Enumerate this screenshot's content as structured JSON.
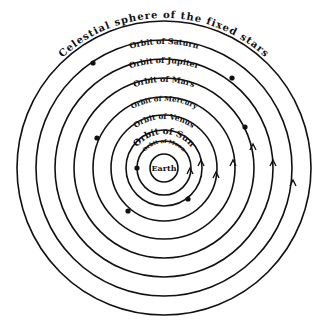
{
  "diagram": {
    "center": {
      "x": 164,
      "y": 168
    },
    "earth": {
      "label": "Earth",
      "radius": 14
    },
    "orbits": [
      {
        "name": "moon",
        "label": "Orbit of Moon",
        "radius": 27,
        "font_size": 6
      },
      {
        "name": "sun",
        "label": "Orbit of Sun",
        "radius": 38,
        "font_size": 9
      },
      {
        "name": "venus",
        "label": "Orbit of Venus",
        "radius": 53,
        "font_size": 8
      },
      {
        "name": "mercury",
        "label": "Orbit of Mercury",
        "radius": 71,
        "font_size": 7.5
      },
      {
        "name": "mars",
        "label": "Orbit of Mars",
        "radius": 90,
        "font_size": 8
      },
      {
        "name": "jupiter",
        "label": "Orbit of Jupiter",
        "radius": 109,
        "font_size": 8
      },
      {
        "name": "saturn",
        "label": "Orbit of Saturn",
        "radius": 128,
        "font_size": 8
      },
      {
        "name": "celestial-sphere",
        "label": "Celestial sphere of the fixed stars",
        "radius": 147,
        "font_size": 10
      }
    ],
    "colors": {
      "ink": "#111111",
      "background": "#ffffff"
    }
  }
}
